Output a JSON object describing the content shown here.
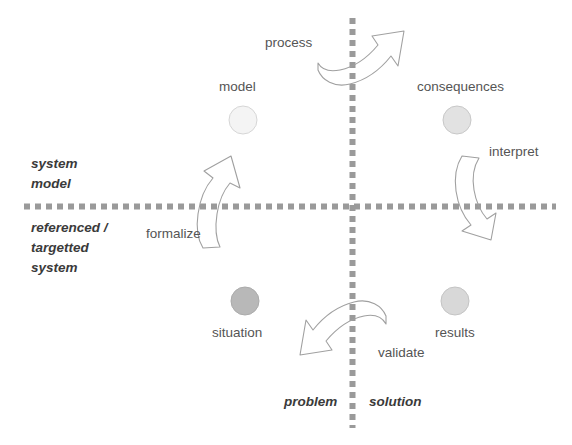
{
  "diagram": {
    "axes": {
      "vertical": {
        "left_label": "problem",
        "right_label": "solution",
        "color": "#9a9a9a",
        "style": "dotted"
      },
      "horizontal": {
        "upper_label_line1": "system",
        "upper_label_line2": "model",
        "lower_label_line1": "referenced /",
        "lower_label_line2": "targetted",
        "lower_label_line3": "system",
        "color": "#9a9a9a",
        "style": "dotted"
      }
    },
    "nodes": [
      {
        "id": "model",
        "label": "model",
        "quadrant": "top-left",
        "fill": "#f4f4f4",
        "stroke": "#d4d4d4",
        "label_position": "above"
      },
      {
        "id": "consequences",
        "label": "consequences",
        "quadrant": "top-right",
        "fill": "#e2e2e2",
        "stroke": "#c4c4c4",
        "label_position": "above"
      },
      {
        "id": "situation",
        "label": "situation",
        "quadrant": "bottom-left",
        "fill": "#b8b8b8",
        "stroke": "#a8a8a8",
        "label_position": "below"
      },
      {
        "id": "results",
        "label": "results",
        "quadrant": "bottom-right",
        "fill": "#d8d8d8",
        "stroke": "#c0c0c0",
        "label_position": "below"
      }
    ],
    "arrows": [
      {
        "id": "process",
        "label": "process",
        "direction": "right",
        "from": "model",
        "to": "consequences",
        "crosses": "vertical-axis"
      },
      {
        "id": "interpret",
        "label": "interpret",
        "direction": "down",
        "from": "consequences",
        "to": "results",
        "crosses": "horizontal-axis"
      },
      {
        "id": "validate",
        "label": "validate",
        "direction": "left",
        "from": "results",
        "to": "situation",
        "crosses": "vertical-axis"
      },
      {
        "id": "formalize",
        "label": "formalize",
        "direction": "up",
        "from": "situation",
        "to": "model",
        "crosses": "horizontal-axis"
      }
    ],
    "colors": {
      "background": "#ffffff",
      "axis_line": "#9a9a9a",
      "arrow_stroke": "#9c9c9c",
      "text": "#4a4a4a"
    }
  }
}
